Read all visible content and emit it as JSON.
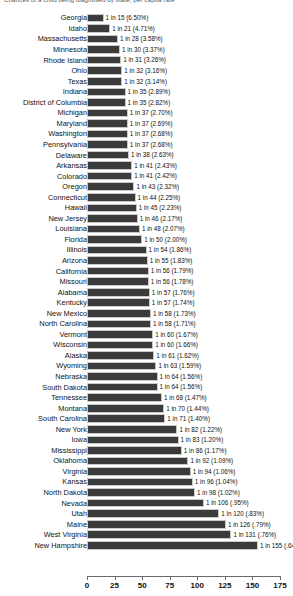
{
  "chart_data": {
    "type": "bar",
    "orientation": "horizontal",
    "title": "Chances of a child being diagnosed by state, per capita rate",
    "xlabel": "",
    "ylabel": "",
    "xlim": [
      0,
      175
    ],
    "xticks": [
      0,
      25,
      50,
      75,
      100,
      125,
      150,
      175
    ],
    "grid": false,
    "legend": "none",
    "bar_color": "#3b3b3b",
    "value_label_format": "1 in N (P%)",
    "categories": [
      "Georgia",
      "Idaho",
      "Massachusetts",
      "Minnesota",
      "Rhode Island",
      "Ohio",
      "Texas",
      "Indiana",
      "District of Columbia",
      "Michigan",
      "Maryland",
      "Washington",
      "Pennsylvania",
      "Delaware",
      "Arkansas",
      "Colorado",
      "Oregon",
      "Connecticut",
      "Hawaii",
      "New Jersey",
      "Louisiana",
      "Florida",
      "Illinois",
      "Arizona",
      "California",
      "Missouri",
      "Alabama",
      "Kentucky",
      "New Mexico",
      "North Carolina",
      "Vermont",
      "Wisconsin",
      "Alaska",
      "Wyoming",
      "Nebraska",
      "South Dakota",
      "Tennessee",
      "Montana",
      "South Carolina",
      "New York",
      "Iowa",
      "Mississippi",
      "Oklahoma",
      "Virginia",
      "Kansas",
      "North Dakota",
      "Nevada",
      "Utah",
      "Maine",
      "West Virginia",
      "New Hampshire"
    ],
    "values": [
      15,
      21,
      28,
      30,
      31,
      32,
      32,
      35,
      35,
      37,
      37,
      37,
      37,
      38,
      41,
      41,
      43,
      44,
      45,
      46,
      48,
      50,
      54,
      55,
      56,
      56,
      57,
      57,
      58,
      58,
      60,
      60,
      61,
      63,
      64,
      64,
      68,
      70,
      71,
      82,
      83,
      86,
      92,
      94,
      96,
      98,
      106,
      120,
      126,
      131,
      155
    ],
    "percents": [
      "6.50%",
      "4.71%",
      "3.58%",
      "3.37%",
      "3.26%",
      "3.16%",
      "3.14%",
      "2.89%",
      "2.82%",
      "2.70%",
      "2.69%",
      "2.68%",
      "2.68%",
      "2.63%",
      "2.43%",
      "2.42%",
      "2.32%",
      "2.25%",
      "2.23%",
      "2.17%",
      "2.07%",
      "2.00%",
      "1.86%",
      "1.83%",
      "1.79%",
      "1.78%",
      "1.76%",
      "1.74%",
      "1.73%",
      "1.71%",
      "1.67%",
      "1.66%",
      "1.62%",
      "1.59%",
      "1.56%",
      "1.56%",
      "1.47%",
      "1.44%",
      "1.40%",
      "1.22%",
      "1.20%",
      "1.17%",
      "1.09%",
      "1.06%",
      "1.04%",
      "1.02%",
      ".95%",
      ".83%",
      ".79%",
      ".76%",
      ".64%"
    ],
    "data_labels": [
      "1 in 15 (6.50%)",
      "1 in 21 (4.71%)",
      "1 in 28 (3.58%)",
      "1 in 30 (3.37%)",
      "1 in 31 (3.26%)",
      "1 in 32 (3.16%)",
      "1 in 32 (3.14%)",
      "1 in 35 (2.89%)",
      "1 in 35 (2.82%)",
      "1 in 37 (2.70%)",
      "1 in 37 (2.69%)",
      "1 in 37 (2.68%)",
      "1 in 37 (2.68%)",
      "1 in 38 (2.63%)",
      "1 in 41 (2.43%)",
      "1 in 41 (2.42%)",
      "1 in 43 (2.32%)",
      "1 in 44 (2.25%)",
      "1 in 45 (2.23%)",
      "1 in 46 (2.17%)",
      "1 in 48 (2.07%)",
      "1 in 50 (2.00%)",
      "1 in 54 (1.86%)",
      "1 in 55 (1.83%)",
      "1 in 56 (1.79%)",
      "1 in 56 (1.78%)",
      "1 in 57 (1.76%)",
      "1 in 57 (1.74%)",
      "1 in 58 (1.73%)",
      "1 in 58 (1.71%)",
      "1 in 60 (1.67%)",
      "1 in 60 (1.66%)",
      "1 in 61 (1.62%)",
      "1 in 63 (1.59%)",
      "1 in 64 (1.56%)",
      "1 in 64 (1.56%)",
      "1 in 68 (1.47%)",
      "1 in 70 (1.44%)",
      "1 in 71 (1.40%)",
      "1 in 82 (1.22%)",
      "1 in 83 (1.20%)",
      "1 in 86 (1.17%)",
      "1 in 92 (1.09%)",
      "1 in 94 (1.06%)",
      "1 in 96 (1.04%)",
      "1 in 98 (1.02%)",
      "1 in 106 (.95%)",
      "1 in 120 (.83%)",
      "1 in 126 (.79%)",
      "1 in 131 (.76%)",
      "1 in 155 (.64%)"
    ]
  }
}
